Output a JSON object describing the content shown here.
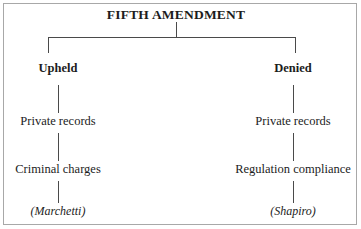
{
  "diagram": {
    "type": "hierarchy-tree",
    "title": "FIFTH AMENDMENT",
    "border_color": "#a8a8a8",
    "line_color": "#4a4a4a",
    "text_color": "#1c1c1c",
    "background": "#ffffff",
    "branches": [
      {
        "label": "Upheld",
        "steps": [
          "Private records",
          "Criminal charges"
        ],
        "case": "(Marchetti)"
      },
      {
        "label": "Denied",
        "steps": [
          "Private records",
          "Regulation compliance"
        ],
        "case": "(Shapiro)"
      }
    ]
  }
}
